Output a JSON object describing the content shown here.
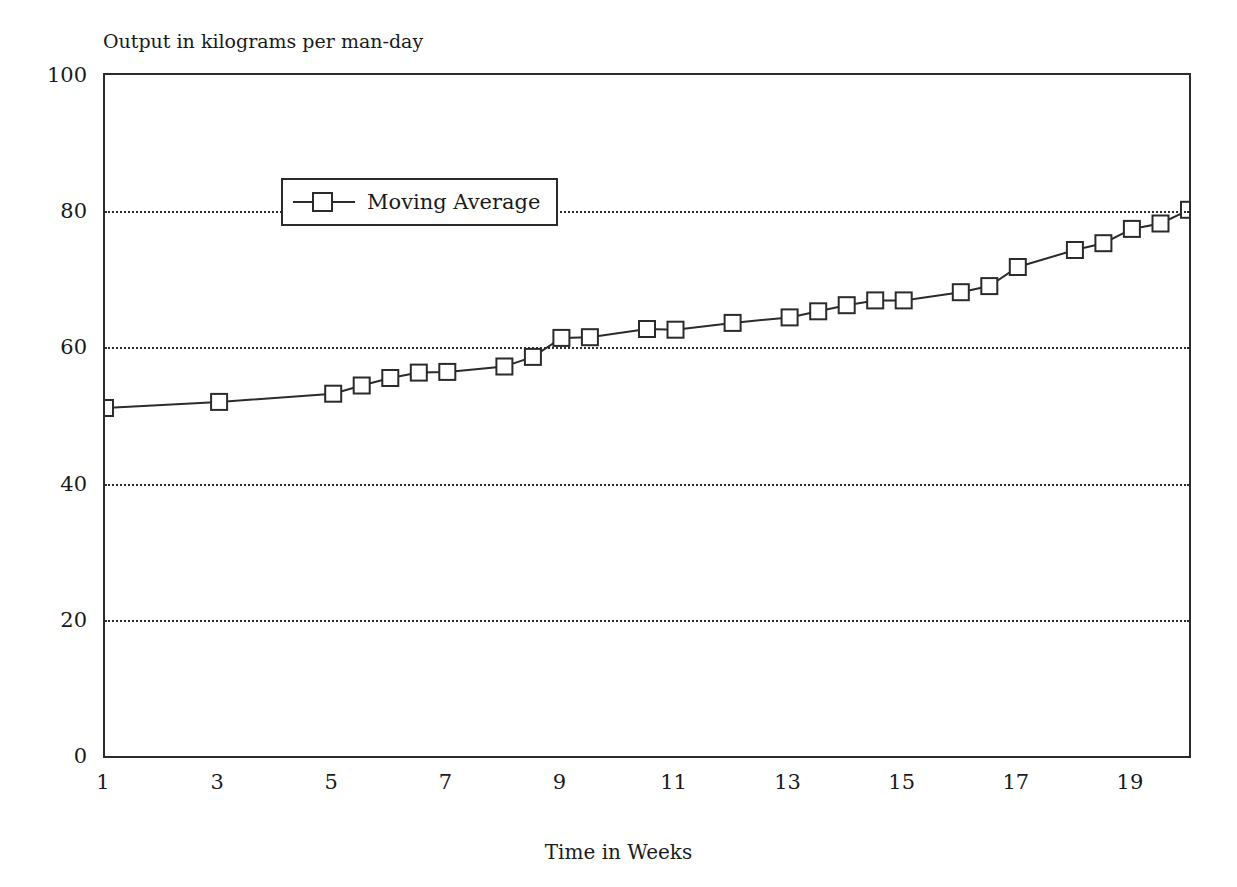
{
  "figure": {
    "title_partial": "",
    "y_axis_caption": "Output in kilograms per man-day",
    "x_axis_caption": "Time in Weeks"
  },
  "legend": {
    "position": "inside-top-left",
    "entries": [
      {
        "label": "Moving Average",
        "marker": "open-square",
        "line": "solid",
        "color": "#2b2b2b"
      }
    ]
  },
  "axis": {
    "y_ticks": [
      "0",
      "20",
      "40",
      "60",
      "80",
      "100"
    ],
    "x_ticks": [
      "1",
      "3",
      "5",
      "7",
      "9",
      "11",
      "13",
      "15",
      "17",
      "19"
    ]
  },
  "chart_data": {
    "type": "line",
    "title": "Output in kilograms per man-day",
    "xlabel": "Time in Weeks",
    "ylabel": "Output in kilograms per man-day",
    "xlim": [
      1,
      20
    ],
    "ylim": [
      0,
      100
    ],
    "grid": true,
    "grid_axis": "y",
    "grid_style": "dotted",
    "legend_position": "upper left (inside plot)",
    "x_tick_values": [
      1,
      3,
      5,
      7,
      9,
      11,
      13,
      15,
      17,
      19
    ],
    "y_tick_values": [
      0,
      20,
      40,
      60,
      80,
      100
    ],
    "series": [
      {
        "name": "Moving Average",
        "marker": "open-square",
        "color": "#2b2b2b",
        "x": [
          1,
          3,
          5,
          5.5,
          6,
          6.5,
          7,
          8,
          8.5,
          9,
          9.5,
          10.5,
          11,
          12,
          13,
          13.5,
          14,
          14.5,
          15,
          16,
          16.5,
          17,
          18,
          18.5,
          19,
          19.5,
          20
        ],
        "values": [
          51.1,
          52.0,
          53.2,
          54.4,
          55.5,
          56.3,
          56.4,
          57.2,
          58.6,
          61.4,
          61.5,
          62.7,
          62.6,
          63.6,
          64.4,
          65.3,
          66.2,
          66.9,
          66.9,
          68.1,
          69.0,
          71.8,
          74.3,
          75.3,
          77.4,
          78.2,
          80.2
        ]
      }
    ]
  }
}
